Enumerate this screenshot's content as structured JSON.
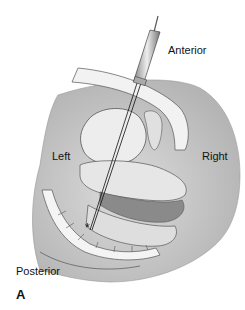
{
  "labels": {
    "anterior": "Anterior",
    "left": "Left",
    "right": "Right",
    "posterior": "Posterior",
    "panel": "A"
  },
  "colors": {
    "background": "#ffffff",
    "body_shade": "#c8c8c8",
    "outline": "#555555",
    "organ_fill": "#e8e8e8",
    "dark_tissue": "#8a8a8a"
  }
}
